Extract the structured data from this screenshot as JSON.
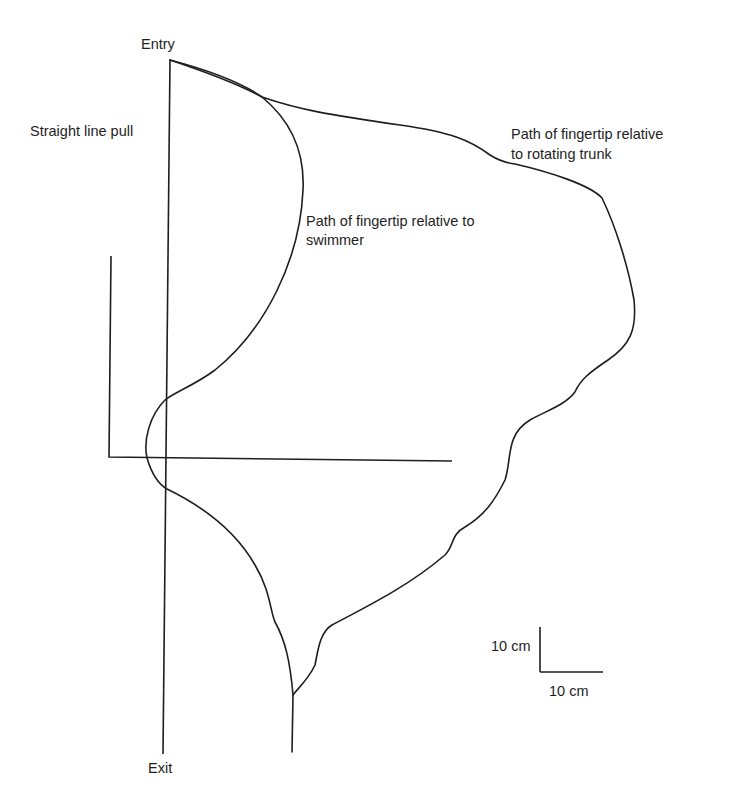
{
  "labels": {
    "entry": "Entry",
    "exit": "Exit",
    "straight_line": "Straight line pull",
    "swimmer_path_line1": "Path of fingertip relative to",
    "swimmer_path_line2": "swimmer",
    "trunk_path_line1": "Path of fingertip relative",
    "trunk_path_line2": "to rotating trunk",
    "scale_vertical": "10 cm",
    "scale_horizontal": "10 cm"
  },
  "colors": {
    "stroke": "#1e1e1e",
    "background": "#ffffff"
  },
  "geometry": {
    "straight_line": "M170,60 L163,754",
    "axes": "M111,256 L109,457 L452,461",
    "swimmer_path": "M170,60 C215,72 245,85 262,97 C290,120 305,150 303,190 C300,260 265,330 215,370 C195,385 175,392 165,400 C150,415 143,440 147,458 C152,475 160,485 167,489 C200,505 235,530 255,565 C270,590 270,610 275,622 C285,640 290,660 293,695 L292,752",
    "trunk_path": "M170,60 C200,70 240,85 262,97 C300,110 330,115 400,125 C450,132 470,140 490,155 C498,160 505,163 515,164 C550,172 590,185 602,198 C615,225 628,265 634,300 C637,330 630,345 608,360 C590,372 580,380 575,392 C565,405 548,410 530,420 C505,435 512,460 505,480 C495,500 485,515 465,527 C450,535 455,545 445,555 C410,585 370,605 332,625 C320,632 318,650 315,665 C308,680 298,688 293,695"
  },
  "scale_bar": {
    "vertical": "M540,627 L540,672",
    "horizontal": "M540,672 L603,672"
  }
}
